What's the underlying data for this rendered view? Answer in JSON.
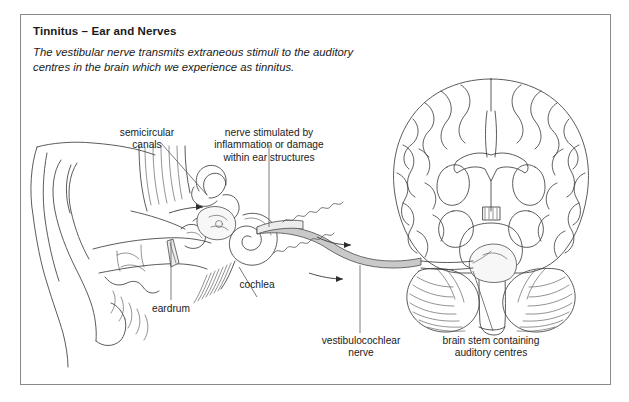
{
  "figure": {
    "title": "Tinnitus – Ear and Nerves",
    "intro": "The vestibular nerve transmits extraneous stimuli to the auditory centres in the brain which we experience as tinnitus.",
    "border_color": "#8a8a8a",
    "background_color": "#ffffff",
    "ink_color": "#3d3d3d",
    "nerve_color": "#c9c9c9"
  },
  "labels": {
    "semicircular_canals": "semicircular\ncanals",
    "nerve_stimulated": "nerve stimulated by\ninflammation or damage\nwithin ear structures",
    "eardrum": "eardrum",
    "cochlea": "cochlea",
    "vestibulocochlear_nerve": "vestibulocochlear\nnerve",
    "brain_stem": "brain stem containing\nauditory centres"
  },
  "anatomy": {
    "left_illustration": "ear-cross-section",
    "right_illustration": "brain-coronal-section",
    "connector": "vestibulocochlear-nerve-band",
    "signal_marks": "squiggly-stimulus-waves",
    "direction_arrows": 3
  }
}
